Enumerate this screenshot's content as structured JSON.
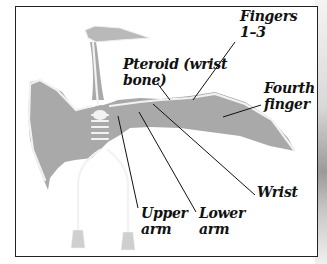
{
  "diagram": {
    "colors": {
      "membrane": "#a9a9a9",
      "bone": "#f2f2f2",
      "frame": "#222222",
      "leader": "#111111"
    },
    "labels": [
      {
        "id": "pteroid",
        "text": "Pteroid (wrist\nbone)"
      },
      {
        "id": "fingers",
        "text": "Fingers\n1–3"
      },
      {
        "id": "fourth",
        "text": "Fourth\nfinger"
      },
      {
        "id": "wrist",
        "text": "Wrist"
      },
      {
        "id": "upper",
        "text": "Upper\narm"
      },
      {
        "id": "lower",
        "text": "Lower\narm"
      }
    ]
  }
}
